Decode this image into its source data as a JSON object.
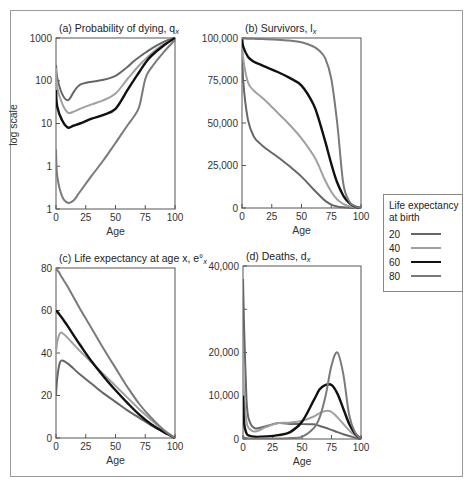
{
  "figure": {
    "legend": {
      "title": "Life expectancy at birth",
      "entries": [
        {
          "label": "20",
          "color": "#666666",
          "width": 2
        },
        {
          "label": "40",
          "color": "#a0a0a0",
          "width": 2
        },
        {
          "label": "60",
          "color": "#111111",
          "width": 2.4
        },
        {
          "label": "80",
          "color": "#7a7a7a",
          "width": 2
        }
      ]
    }
  },
  "chart_data": [
    {
      "id": "a",
      "type": "line",
      "title": "(a)  Probability of dying, q",
      "title_subscript": "x",
      "xlabel": "Age",
      "ylabel": "log scale",
      "yscale": "log",
      "xlim": [
        0,
        100
      ],
      "ylim": [
        0.1,
        1000
      ],
      "xticks": [
        0,
        25,
        50,
        75,
        100
      ],
      "yticks": [
        {
          "value": 1000,
          "label": "1000"
        },
        {
          "value": 100,
          "label": "100"
        },
        {
          "value": 10,
          "label": "10"
        },
        {
          "value": 1,
          "label": "1"
        },
        {
          "value": 0.1,
          "label": "1"
        }
      ],
      "grid": false,
      "x": [
        0,
        1,
        5,
        10,
        15,
        20,
        30,
        40,
        50,
        60,
        65,
        70,
        75,
        80,
        90,
        100
      ],
      "series": [
        {
          "name": "20",
          "values": [
            230,
            120,
            50,
            35,
            55,
            80,
            95,
            105,
            130,
            210,
            280,
            360,
            450,
            560,
            800,
            1000
          ]
        },
        {
          "name": "40",
          "values": [
            200,
            70,
            30,
            18,
            19,
            22,
            28,
            35,
            50,
            110,
            160,
            230,
            320,
            430,
            700,
            1000
          ]
        },
        {
          "name": "60",
          "values": [
            60,
            25,
            12,
            8,
            9,
            10,
            13,
            16,
            22,
            60,
            100,
            160,
            260,
            380,
            650,
            1000
          ]
        },
        {
          "name": "80",
          "values": [
            2.5,
            0.6,
            0.2,
            0.14,
            0.16,
            0.25,
            0.6,
            1.4,
            3.5,
            9,
            14,
            25,
            110,
            200,
            450,
            900
          ]
        }
      ]
    },
    {
      "id": "b",
      "type": "line",
      "title": "(b)  Survivors, l",
      "title_subscript": "x",
      "xlabel": "Age",
      "ylabel": "",
      "yscale": "linear",
      "xlim": [
        0,
        100
      ],
      "ylim": [
        0,
        100000
      ],
      "xticks": [
        0,
        25,
        50,
        75,
        100
      ],
      "yticks": [
        {
          "value": 100000,
          "label": "100,000"
        },
        {
          "value": 75000,
          "label": "75,000"
        },
        {
          "value": 50000,
          "label": "50,000"
        },
        {
          "value": 25000,
          "label": "25,000"
        },
        {
          "value": 0,
          "label": "0"
        }
      ],
      "grid": false,
      "x": [
        0,
        1,
        5,
        10,
        15,
        20,
        30,
        40,
        50,
        60,
        65,
        70,
        75,
        80,
        85,
        90,
        95,
        100
      ],
      "series": [
        {
          "name": "20",
          "values": [
            100000,
            75000,
            52000,
            42000,
            38000,
            35000,
            30000,
            24500,
            18500,
            11000,
            7500,
            4200,
            2000,
            900,
            400,
            150,
            50,
            0
          ]
        },
        {
          "name": "40",
          "values": [
            100000,
            88000,
            74000,
            69000,
            66000,
            63000,
            56000,
            49000,
            41000,
            31000,
            24000,
            16000,
            9500,
            5000,
            2500,
            1000,
            300,
            0
          ]
        },
        {
          "name": "60",
          "values": [
            100000,
            95000,
            89000,
            86000,
            84500,
            83000,
            80000,
            76500,
            72000,
            61000,
            51000,
            39000,
            26000,
            15000,
            7500,
            3000,
            800,
            0
          ]
        },
        {
          "name": "80",
          "values": [
            100000,
            99700,
            99600,
            99500,
            99400,
            99300,
            99000,
            98500,
            97500,
            95000,
            92500,
            88000,
            76000,
            50000,
            15000,
            4000,
            1000,
            0
          ]
        }
      ]
    },
    {
      "id": "c",
      "type": "line",
      "title": "(c)  Life expectancy at age x, e°",
      "title_subscript": "x",
      "xlabel": "Age",
      "ylabel": "",
      "yscale": "linear",
      "xlim": [
        0,
        100
      ],
      "ylim": [
        0,
        80
      ],
      "xticks": [
        0,
        25,
        50,
        75,
        100
      ],
      "yticks": [
        {
          "value": 80,
          "label": "80"
        },
        {
          "value": 60,
          "label": "60"
        },
        {
          "value": 40,
          "label": "40"
        },
        {
          "value": 20,
          "label": "20"
        },
        {
          "value": 0,
          "label": "0"
        }
      ],
      "grid": false,
      "x": [
        0,
        1,
        3,
        5,
        10,
        20,
        30,
        40,
        50,
        60,
        70,
        80,
        90,
        95,
        100
      ],
      "series": [
        {
          "name": "20",
          "values": [
            20,
            28,
            35,
            36.5,
            35,
            30,
            25.5,
            21,
            17,
            13,
            9.5,
            6,
            3,
            1.5,
            0
          ]
        },
        {
          "name": "40",
          "values": [
            40,
            45,
            49,
            49.5,
            47,
            41,
            35.5,
            30,
            24.5,
            19,
            13.5,
            8.5,
            4,
            2,
            0
          ]
        },
        {
          "name": "60",
          "values": [
            60,
            59.5,
            58,
            56.5,
            52.5,
            44,
            36,
            29,
            22.5,
            16.5,
            11,
            6.5,
            3,
            1.5,
            0
          ]
        },
        {
          "name": "80",
          "values": [
            80,
            79,
            77.5,
            75.5,
            71,
            61,
            51.5,
            42,
            33,
            24,
            16,
            9.5,
            4,
            1.8,
            0
          ]
        }
      ]
    },
    {
      "id": "d",
      "type": "line",
      "title": "(d)  Deaths, d",
      "title_subscript": "x",
      "xlabel": "Age",
      "ylabel": "",
      "yscale": "linear",
      "xlim": [
        0,
        100
      ],
      "ylim": [
        0,
        40000
      ],
      "xticks": [
        0,
        25,
        50,
        75,
        100
      ],
      "yticks": [
        {
          "value": 40000,
          "label": "40,000"
        },
        {
          "value": 30000,
          "label": ""
        },
        {
          "value": 20000,
          "label": "20,000"
        },
        {
          "value": 10000,
          "label": "10,000"
        },
        {
          "value": 0,
          "label": "0"
        }
      ],
      "grid": false,
      "x": [
        0,
        1,
        3,
        5,
        10,
        20,
        30,
        40,
        50,
        60,
        65,
        70,
        75,
        80,
        85,
        90,
        95,
        100
      ],
      "series": [
        {
          "name": "20",
          "values": [
            37000,
            25000,
            9000,
            4500,
            2500,
            3000,
            3700,
            3500,
            3500,
            3400,
            3000,
            2600,
            2100,
            1600,
            1100,
            700,
            300,
            0
          ]
        },
        {
          "name": "40",
          "values": [
            20000,
            10000,
            4000,
            2500,
            1700,
            2800,
            3700,
            3800,
            4200,
            5200,
            6000,
            6500,
            6300,
            5000,
            3500,
            2000,
            800,
            0
          ]
        },
        {
          "name": "60",
          "values": [
            10000,
            3500,
            1300,
            800,
            500,
            600,
            900,
            1600,
            4000,
            9000,
            11500,
            12500,
            12500,
            10500,
            7000,
            3500,
            1200,
            0
          ]
        },
        {
          "name": "80",
          "values": [
            700,
            300,
            200,
            150,
            100,
            100,
            100,
            200,
            500,
            2500,
            5000,
            10000,
            17000,
            20000,
            15000,
            5500,
            1500,
            0
          ]
        }
      ]
    }
  ]
}
